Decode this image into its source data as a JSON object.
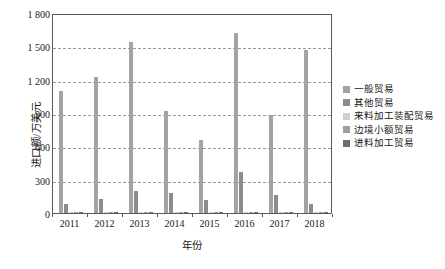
{
  "chart_data": {
    "type": "bar",
    "title": "",
    "subtitle": "",
    "xlabel": "年份",
    "ylabel": "进口额/万美元",
    "categories": [
      "2011",
      "2012",
      "2013",
      "2014",
      "2015",
      "2016",
      "2017",
      "2018"
    ],
    "ylim": [
      0,
      1800
    ],
    "yticks": [
      0,
      300,
      600,
      900,
      1200,
      1500,
      1800
    ],
    "ytick_labels": [
      "0",
      "300",
      "600",
      "900",
      "1 200",
      "1 500",
      "1 800"
    ],
    "grid": "horizontal-dashed",
    "legend_position": "right",
    "series": [
      {
        "name": "一般贸易",
        "color": "#a3a3a3",
        "values": [
          1100,
          1220,
          1540,
          920,
          660,
          1620,
          880,
          1470
        ]
      },
      {
        "name": "其他贸易",
        "color": "#8c8c8c",
        "values": [
          85,
          130,
          200,
          180,
          120,
          370,
          165,
          85
        ]
      },
      {
        "name": "来料加工装配贸易",
        "color": "#cfcfcf",
        "values": [
          8,
          6,
          7,
          5,
          6,
          9,
          5,
          6
        ]
      },
      {
        "name": "边境小额贸易",
        "color": "#9e9e9e",
        "values": [
          10,
          12,
          9,
          8,
          10,
          11,
          9,
          10
        ]
      },
      {
        "name": "进料加工贸易",
        "color": "#6e6e6e",
        "values": [
          5,
          4,
          5,
          4,
          5,
          6,
          4,
          5
        ]
      }
    ]
  },
  "axes": {
    "y_title": "进口额/万美元",
    "x_title": "年份"
  },
  "legend": {
    "items": [
      {
        "label": "一般贸易",
        "color": "#a3a3a3"
      },
      {
        "label": "其他贸易",
        "color": "#8c8c8c"
      },
      {
        "label": "来料加工装配贸易",
        "color": "#cfcfcf"
      },
      {
        "label": "边境小额贸易",
        "color": "#9e9e9e"
      },
      {
        "label": "进料加工贸易",
        "color": "#6e6e6e"
      }
    ]
  },
  "style": {
    "frame_color": "#595959",
    "grid_color": "#9a9a9a",
    "background": "#ffffff",
    "text_color": "#171717"
  }
}
